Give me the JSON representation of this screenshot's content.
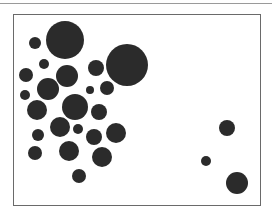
{
  "figure": {
    "type": "circle-arrangement",
    "circle_color": "#2b2b2b",
    "frame_color": "#6a6a6a",
    "top_rule_color": "#9a9a9a",
    "circles": [
      {
        "cx": 65,
        "cy": 40,
        "r": 19
      },
      {
        "cx": 35,
        "cy": 43,
        "r": 6
      },
      {
        "cx": 127,
        "cy": 65,
        "r": 21
      },
      {
        "cx": 44,
        "cy": 64,
        "r": 5
      },
      {
        "cx": 26,
        "cy": 75,
        "r": 7
      },
      {
        "cx": 67,
        "cy": 76,
        "r": 11
      },
      {
        "cx": 96,
        "cy": 68,
        "r": 8
      },
      {
        "cx": 48,
        "cy": 89,
        "r": 11
      },
      {
        "cx": 25,
        "cy": 95,
        "r": 5
      },
      {
        "cx": 90,
        "cy": 90,
        "r": 4
      },
      {
        "cx": 107,
        "cy": 88,
        "r": 7
      },
      {
        "cx": 37,
        "cy": 110,
        "r": 10
      },
      {
        "cx": 75,
        "cy": 107,
        "r": 13
      },
      {
        "cx": 99,
        "cy": 112,
        "r": 8
      },
      {
        "cx": 60,
        "cy": 127,
        "r": 10
      },
      {
        "cx": 78,
        "cy": 129,
        "r": 5
      },
      {
        "cx": 38,
        "cy": 135,
        "r": 6
      },
      {
        "cx": 94,
        "cy": 137,
        "r": 8
      },
      {
        "cx": 116,
        "cy": 133,
        "r": 10
      },
      {
        "cx": 35,
        "cy": 153,
        "r": 7
      },
      {
        "cx": 69,
        "cy": 151,
        "r": 10
      },
      {
        "cx": 102,
        "cy": 157,
        "r": 10
      },
      {
        "cx": 79,
        "cy": 176,
        "r": 7
      },
      {
        "cx": 227,
        "cy": 128,
        "r": 8
      },
      {
        "cx": 206,
        "cy": 161,
        "r": 5
      },
      {
        "cx": 237,
        "cy": 183,
        "r": 11
      }
    ]
  }
}
